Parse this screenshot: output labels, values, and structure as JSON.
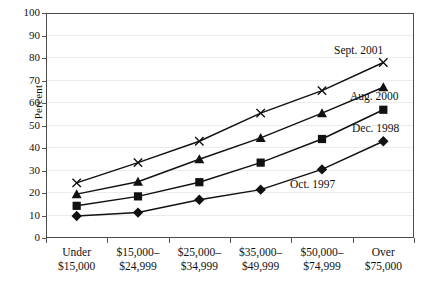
{
  "chart_data": {
    "type": "line",
    "title": "",
    "xlabel": "",
    "ylabel": "Percent",
    "ylim": [
      0,
      100
    ],
    "ytick_values": [
      0,
      10,
      20,
      30,
      40,
      50,
      60,
      70,
      80,
      90,
      100
    ],
    "grid": true,
    "legend_position": "inline-annotations",
    "categories": [
      "Under\n$15,000",
      "$15,000–\n$24,999",
      "$25,000–\n$34,999",
      "$35,000–\n$49,999",
      "$50,000–\n$74,999",
      "Over $75,000"
    ],
    "category_lines": [
      [
        "Under",
        "$15,000"
      ],
      [
        "$15,000–",
        "$24,999"
      ],
      [
        "$25,000–",
        "$34,999"
      ],
      [
        "$35,000–",
        "$49,999"
      ],
      [
        "$50,000–",
        "$74,999"
      ],
      [
        "Over $75,000",
        ""
      ]
    ],
    "series": [
      {
        "name": "Sept. 2001",
        "marker": "x",
        "values": [
          24.5,
          33.5,
          43.0,
          55.5,
          65.5,
          78.0
        ]
      },
      {
        "name": "Aug. 2000",
        "marker": "triangle",
        "values": [
          19.5,
          25.0,
          35.0,
          44.5,
          55.5,
          67.0
        ]
      },
      {
        "name": "Dec. 1998",
        "marker": "square",
        "values": [
          14.3,
          18.5,
          24.8,
          33.5,
          44.0,
          57.0
        ]
      },
      {
        "name": "Oct. 1997",
        "marker": "diamond",
        "values": [
          9.8,
          11.3,
          17.0,
          21.5,
          30.5,
          43.0
        ]
      }
    ],
    "annotations": [
      {
        "text": "Sept. 2001",
        "series": "Sept. 2001"
      },
      {
        "text": "Aug. 2000",
        "series": "Aug. 2000"
      },
      {
        "text": "Dec. 1998",
        "series": "Dec. 1998"
      },
      {
        "text": "Oct. 1997",
        "series": "Oct. 1997"
      }
    ],
    "colors": {
      "line": "#111111",
      "grid": "#ececec",
      "axis": "#4a4a4a"
    }
  }
}
